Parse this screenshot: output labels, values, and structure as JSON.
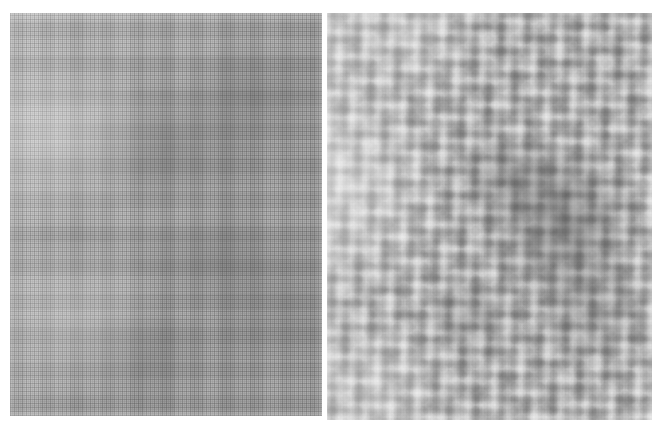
{
  "figure": {
    "title": "",
    "caption": "",
    "background_color": "#ffffff",
    "width_px": 658,
    "height_px": 430,
    "layout": "two-panel side-by-side, no labels or axes",
    "colorspace": "grayscale"
  },
  "panels": [
    {
      "id": "left",
      "label": "",
      "position": {
        "x": 10,
        "y": 13,
        "width": 312,
        "height": 403
      },
      "texture": "fine orthogonal woven mesh",
      "grid_period_px": 4,
      "mean_gray_hex": "#bdbdbd",
      "light_gray_hex": "#d8d8d8",
      "dark_gray_hex": "#9a9a9a",
      "description": "Uniform fine cross-hatched weave with faint mid-scale blocky patches; darker mottling toward the centre and right, lighter toward the upper-left."
    },
    {
      "id": "right",
      "label": "",
      "position": {
        "x": 327,
        "y": 13,
        "width": 325,
        "height": 407
      },
      "texture": "coarse cellular blob field",
      "blob_period_px": 13,
      "mean_gray_hex": "#b4b4b4",
      "light_gray_hex": "#dcdcdc",
      "dark_gray_hex": "#8a8a8a",
      "description": "Rounded granular blobs of roughly uniform size; a pronounced darker lobe occupies the centre-right, with brighter regions along the left edge and lower-left corner."
    }
  ],
  "chart_data": {
    "type": "heatmap",
    "title": "",
    "xlabel": "",
    "ylabel": "",
    "legend": [],
    "grid": false,
    "panels": [
      {
        "name": "left",
        "kind": "fine-weave-texture",
        "gray_range": [
          148,
          222
        ],
        "dominant_period_px": 4,
        "structure": "bi-directional grid"
      },
      {
        "name": "right",
        "kind": "coarse-blob-texture",
        "gray_range": [
          130,
          226
        ],
        "dominant_period_px": 13,
        "structure": "isotropic cellular"
      }
    ]
  }
}
